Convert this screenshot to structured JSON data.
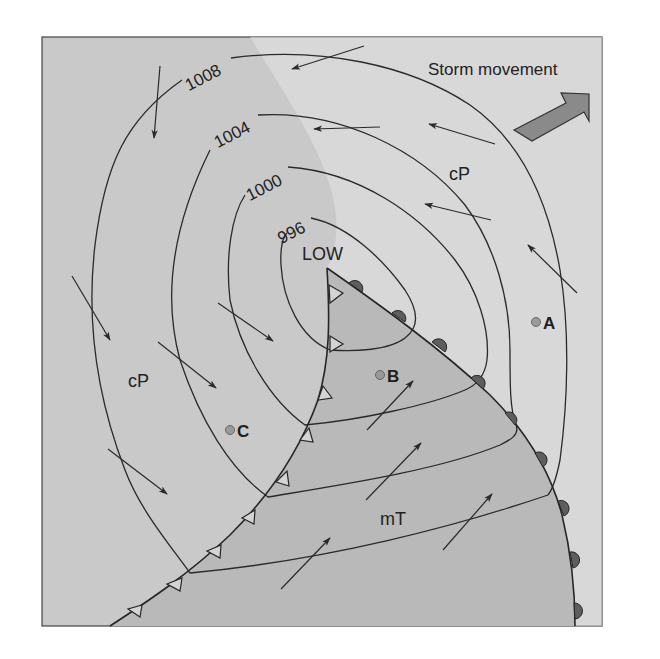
{
  "title": "Storm movement",
  "low_label": "LOW",
  "isobars": [
    {
      "value": "996",
      "label": "996"
    },
    {
      "value": "1000",
      "label": "1000"
    },
    {
      "value": "1004",
      "label": "1004"
    },
    {
      "value": "1008",
      "label": "1008"
    }
  ],
  "air_masses": {
    "cp_north": "cP",
    "cp_west": "cP",
    "mt": "mT"
  },
  "points": {
    "a": "A",
    "b": "B",
    "c": "C"
  },
  "fronts": {
    "cold_front": "cold-front",
    "warm_front": "warm-front"
  },
  "colors": {
    "cold_region": "#c9c9c9",
    "warm_outer_region": "#e4e4e4",
    "warm_sector": "#b9b9b9",
    "storm_arrow": "#8a8a8a",
    "point_marker": "#9a9a9a",
    "warm_front_bump": "#5e5e5e",
    "cold_front_triangle": "#d2d2d2"
  }
}
